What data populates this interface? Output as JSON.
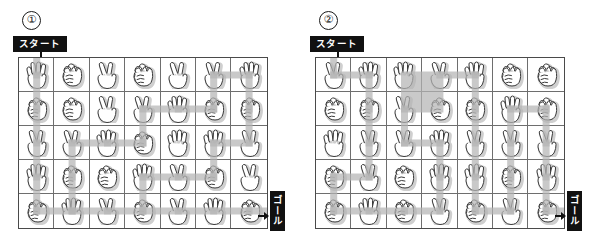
{
  "panels": [
    {
      "number": "①",
      "start_label": "スタート",
      "goal_label": "ゴール",
      "start_icon": "down-arrow-icon",
      "goal_icon": "right-arrow-icon",
      "columns": 7,
      "rows": 5,
      "grid": [
        [
          "paper",
          "rock",
          "scissors",
          "rock",
          "scissors",
          "scissors",
          "paper"
        ],
        [
          "rock",
          "rock",
          "scissors",
          "scissors",
          "paper",
          "rock",
          "rock"
        ],
        [
          "scissors",
          "scissors",
          "paper",
          "rock",
          "paper",
          "paper",
          "scissors"
        ],
        [
          "paper",
          "rock",
          "rock",
          "paper",
          "scissors",
          "rock",
          "scissors"
        ],
        [
          "rock",
          "paper",
          "scissors",
          "rock",
          "scissors",
          "paper",
          "rock"
        ]
      ],
      "path": [
        [
          0,
          0
        ],
        [
          1,
          0
        ],
        [
          2,
          0
        ],
        [
          3,
          0
        ],
        [
          4,
          0
        ],
        [
          4,
          1
        ],
        [
          4,
          2
        ],
        [
          4,
          3
        ],
        [
          3,
          3
        ],
        [
          3,
          4
        ],
        [
          3,
          5
        ],
        [
          2,
          5
        ],
        [
          2,
          6
        ],
        [
          1,
          6
        ],
        [
          0,
          6
        ],
        [
          0,
          5
        ],
        [
          1,
          5
        ],
        [
          1,
          4
        ],
        [
          1,
          3
        ],
        [
          2,
          3
        ],
        [
          2,
          2
        ],
        [
          2,
          1
        ],
        [
          3,
          1
        ],
        [
          4,
          1
        ],
        [
          4,
          2
        ],
        [
          4,
          3
        ],
        [
          4,
          4
        ],
        [
          4,
          5
        ],
        [
          4,
          6
        ]
      ]
    },
    {
      "number": "②",
      "start_label": "スタート",
      "goal_label": "ゴール",
      "start_icon": "down-arrow-icon",
      "goal_icon": "right-arrow-icon",
      "columns": 7,
      "rows": 5,
      "grid": [
        [
          "scissors",
          "paper",
          "paper",
          "scissors",
          "paper",
          "rock",
          "rock"
        ],
        [
          "rock",
          "rock",
          "scissors",
          "rock",
          "rock",
          "paper",
          "rock"
        ],
        [
          "paper",
          "scissors",
          "scissors",
          "paper",
          "scissors",
          "scissors",
          "scissors"
        ],
        [
          "rock",
          "scissors",
          "rock",
          "paper",
          "paper",
          "rock",
          "paper"
        ],
        [
          "rock",
          "paper",
          "rock",
          "scissors",
          "rock",
          "scissors",
          "rock"
        ]
      ],
      "path": [
        [
          0,
          0
        ],
        [
          0,
          1
        ],
        [
          1,
          1
        ],
        [
          2,
          1
        ],
        [
          3,
          1
        ],
        [
          3,
          0
        ],
        [
          4,
          0
        ],
        [
          4,
          1
        ],
        [
          4,
          2
        ],
        [
          4,
          3
        ],
        [
          3,
          3
        ],
        [
          2,
          3
        ],
        [
          2,
          2
        ],
        [
          1,
          2
        ],
        [
          0,
          3
        ],
        [
          0,
          4
        ],
        [
          1,
          4
        ],
        [
          2,
          4
        ],
        [
          3,
          4
        ],
        [
          4,
          4
        ],
        [
          4,
          5
        ],
        [
          3,
          5
        ],
        [
          2,
          5
        ],
        [
          1,
          5
        ],
        [
          1,
          6
        ],
        [
          2,
          6
        ],
        [
          3,
          6
        ],
        [
          4,
          6
        ]
      ]
    }
  ],
  "hand_icons": {
    "rock": "rock-hand-icon",
    "paper": "paper-hand-icon",
    "scissors": "scissors-hand-icon"
  },
  "colors": {
    "label_background": "#111111",
    "label_text": "#ffffff",
    "grid_line": "#6e6e6e",
    "grid_border": "#4a4a4a",
    "path_highlight": "#b4b4b4",
    "hand_outline": "#3a3a3a",
    "hand_shadow": "#cfcfcf"
  }
}
